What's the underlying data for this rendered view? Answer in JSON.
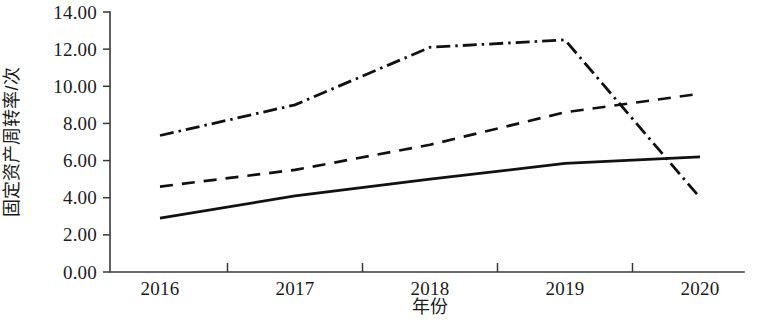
{
  "chart_data": {
    "type": "line",
    "title": "",
    "xlabel": "年份",
    "ylabel": "固定资产周转率/次",
    "categories": [
      "2016",
      "2017",
      "2018",
      "2019",
      "2020"
    ],
    "x": [
      2016,
      2017,
      2018,
      2019,
      2020
    ],
    "xlim": [
      2016,
      2020
    ],
    "ylim": [
      0.0,
      14.0
    ],
    "yticks": [
      "0.00",
      "2.00",
      "4.00",
      "6.00",
      "8.00",
      "10.00",
      "12.00",
      "14.00"
    ],
    "ytick_values": [
      0.0,
      2.0,
      4.0,
      6.0,
      8.0,
      10.0,
      12.0,
      14.0
    ],
    "xticks": [
      "2016",
      "2017",
      "2018",
      "2019",
      "2020"
    ],
    "grid": false,
    "legend": "none",
    "series": [
      {
        "name": "dash-dot-series",
        "style": "dash-dot",
        "color": "#111111",
        "values": [
          7.35,
          9.0,
          12.1,
          12.5,
          4.0
        ]
      },
      {
        "name": "dashed-series",
        "style": "dashed",
        "color": "#111111",
        "values": [
          4.6,
          5.5,
          6.85,
          8.6,
          9.6
        ]
      },
      {
        "name": "solid-series",
        "style": "solid",
        "color": "#111111",
        "values": [
          2.9,
          4.1,
          5.0,
          5.85,
          6.2
        ]
      }
    ]
  }
}
